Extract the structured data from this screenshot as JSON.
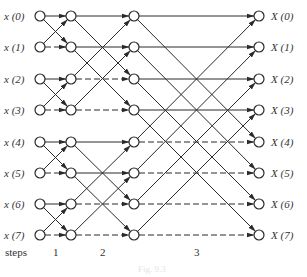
{
  "diagram": {
    "type": "fft-butterfly-signal-flow",
    "inputs": [
      "x (0)",
      "x (1)",
      "x (2)",
      "x (3)",
      "x (4)",
      "x (5)",
      "x (6)",
      "x (7)"
    ],
    "outputs": [
      "X (0)",
      "X (1)",
      "X (2)",
      "X (3)",
      "X (4)",
      "X (5)",
      "X (6)",
      "X (7)"
    ],
    "steps_label": "steps",
    "steps": [
      "1",
      "2",
      "3"
    ],
    "caption": "Fig. 9.3",
    "colors": {
      "line": "#2a2a2a",
      "node_fill": "#ffffff",
      "text": "#333333"
    },
    "layout": {
      "columns_x": [
        40,
        71,
        134,
        259
      ],
      "rows_y": [
        16,
        47,
        79,
        110,
        142,
        173,
        204,
        235
      ],
      "node_radius": 5
    },
    "stages": [
      {
        "step": "1",
        "span": 1,
        "dashed_rows": [
          1,
          3,
          5,
          7
        ]
      },
      {
        "step": "2",
        "span": 2,
        "dashed_rows": [
          2,
          3,
          6,
          7
        ]
      },
      {
        "step": "3",
        "span": 4,
        "dashed_rows": [
          4,
          5,
          6,
          7
        ]
      }
    ]
  }
}
